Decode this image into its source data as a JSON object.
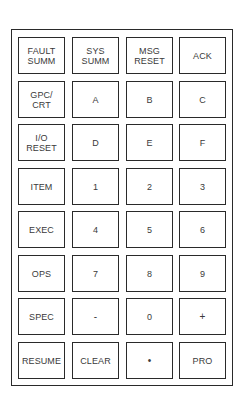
{
  "keypad": {
    "title": "",
    "rows": [
      [
        {
          "label": "FAULT\nSUMM",
          "name": "fault-summ"
        },
        {
          "label": "SYS\nSUMM",
          "name": "sys-summ"
        },
        {
          "label": "MSG\nRESET",
          "name": "msg-reset"
        },
        {
          "label": "ACK",
          "name": "ack"
        }
      ],
      [
        {
          "label": "GPC/\nCRT",
          "name": "gpc-crt"
        },
        {
          "label": "A",
          "name": "a"
        },
        {
          "label": "B",
          "name": "b"
        },
        {
          "label": "C",
          "name": "c"
        }
      ],
      [
        {
          "label": "I/O\nRESET",
          "name": "io-reset"
        },
        {
          "label": "D",
          "name": "d"
        },
        {
          "label": "E",
          "name": "e"
        },
        {
          "label": "F",
          "name": "f"
        }
      ],
      [
        {
          "label": "ITEM",
          "name": "item"
        },
        {
          "label": "1",
          "name": "1"
        },
        {
          "label": "2",
          "name": "2"
        },
        {
          "label": "3",
          "name": "3"
        }
      ],
      [
        {
          "label": "EXEC",
          "name": "exec"
        },
        {
          "label": "4",
          "name": "4"
        },
        {
          "label": "5",
          "name": "5"
        },
        {
          "label": "6",
          "name": "6"
        }
      ],
      [
        {
          "label": "OPS",
          "name": "ops"
        },
        {
          "label": "7",
          "name": "7"
        },
        {
          "label": "8",
          "name": "8"
        },
        {
          "label": "9",
          "name": "9"
        }
      ],
      [
        {
          "label": "SPEC",
          "name": "spec"
        },
        {
          "label": "-",
          "name": "minus"
        },
        {
          "label": "0",
          "name": "0"
        },
        {
          "label": "+",
          "name": "plus"
        }
      ],
      [
        {
          "label": "RESUME",
          "name": "resume"
        },
        {
          "label": "CLEAR",
          "name": "clear"
        },
        {
          "label": "•",
          "name": "decimal-point"
        },
        {
          "label": "PRO",
          "name": "pro"
        }
      ]
    ]
  },
  "colors": {
    "border": "#2a2a2a",
    "text": "#3a3a3a",
    "background": "#ffffff"
  }
}
